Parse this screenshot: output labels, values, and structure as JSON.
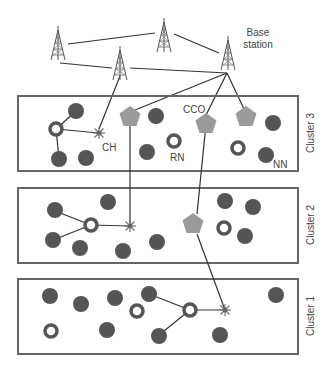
{
  "labels": {
    "base_station": [
      "Base",
      "station"
    ],
    "ch": "CH",
    "rn": "RN",
    "cco": "CCO",
    "nn": "NN"
  },
  "clusters": [
    {
      "name": "Cluster 3"
    },
    {
      "name": "Cluster 2"
    },
    {
      "name": "Cluster 1"
    }
  ],
  "colors": {
    "node": "#555555",
    "pentagon": "#9a9a9a",
    "line": "#333333",
    "box": "#666666",
    "ch": "#666666"
  }
}
